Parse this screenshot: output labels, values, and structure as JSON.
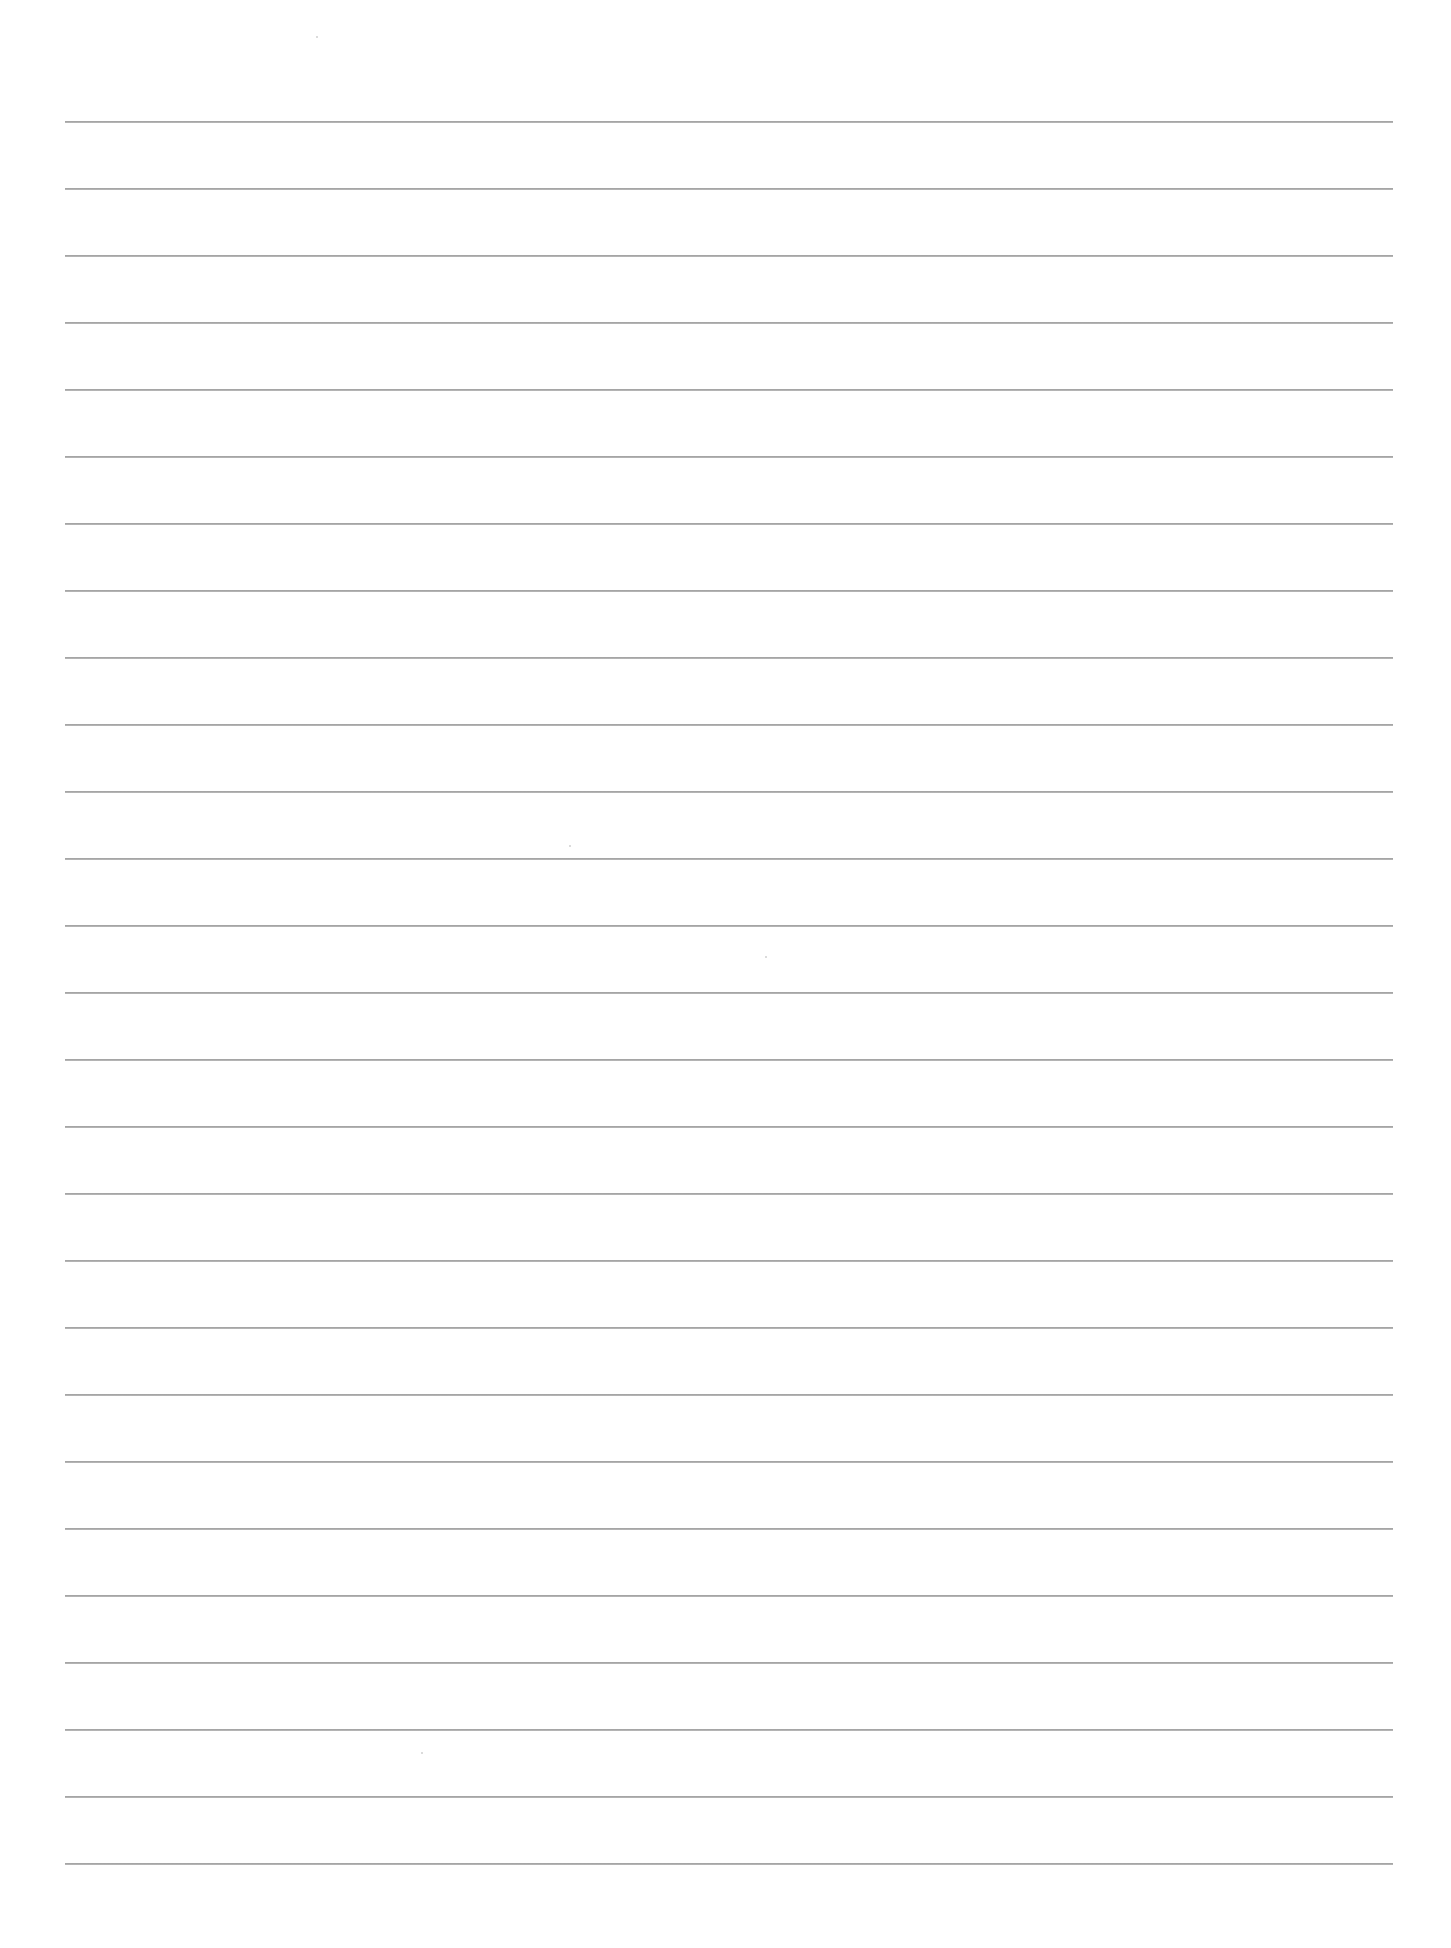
{
  "document": {
    "type": "blank ruled paper",
    "background_color": "#ffffff",
    "line_color": "#8c8c8c"
  },
  "ruling": {
    "line_count": 27,
    "first_line_y": 122,
    "line_spacing": 67,
    "left_x": 65,
    "right_x": 1393
  },
  "specks": [
    {
      "x": 316,
      "y": 36
    },
    {
      "x": 569,
      "y": 845
    },
    {
      "x": 765,
      "y": 956
    },
    {
      "x": 421,
      "y": 1752
    }
  ]
}
